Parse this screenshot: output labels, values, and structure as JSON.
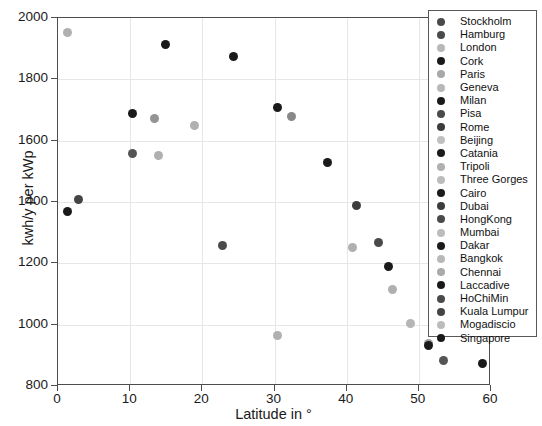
{
  "chart_data": {
    "type": "scatter",
    "title": "",
    "xlabel": "Latitude in °",
    "ylabel": "kwh/y per kWp",
    "xlim": [
      0,
      60
    ],
    "ylim": [
      800,
      2000
    ],
    "xticks": [
      "0",
      "10",
      "20",
      "30",
      "40",
      "50",
      "60"
    ],
    "yticks": [
      "800",
      "1000",
      "1200",
      "1400",
      "1600",
      "1800",
      "2000"
    ],
    "grid": true,
    "legend_position": "top-right-outside",
    "points": [
      {
        "label": "Stockholm",
        "x": 59.0,
        "y": 870,
        "color": "#1a1a1a"
      },
      {
        "label": "Hamburg",
        "x": 53.5,
        "y": 880,
        "color": "#555555"
      },
      {
        "label": "London",
        "x": 51.5,
        "y": 935,
        "color": "#a0a0a0"
      },
      {
        "label": "Cork",
        "x": 51.5,
        "y": 930,
        "color": "#1a1a1a"
      },
      {
        "label": "Paris",
        "x": 49.0,
        "y": 1000,
        "color": "#b5b5b5"
      },
      {
        "label": "Geneva",
        "x": 46.5,
        "y": 1110,
        "color": "#b0b0b0"
      },
      {
        "label": "Milan",
        "x": 46.0,
        "y": 1185,
        "color": "#1a1a1a"
      },
      {
        "label": "Pisa",
        "x": 44.5,
        "y": 1265,
        "color": "#4a4a4a"
      },
      {
        "label": "Rome",
        "x": 41.5,
        "y": 1385,
        "color": "#3c3c3c"
      },
      {
        "label": "Beijing",
        "x": 41.0,
        "y": 1250,
        "color": "#b0b0b0"
      },
      {
        "label": "Catania",
        "x": 37.5,
        "y": 1525,
        "color": "#1a1a1a"
      },
      {
        "label": "Tripoli",
        "x": 32.5,
        "y": 1675,
        "color": "#888888"
      },
      {
        "label": "Three Gorges",
        "x": 30.5,
        "y": 960,
        "color": "#b0b0b0"
      },
      {
        "label": "Cairo",
        "x": 30.5,
        "y": 1705,
        "color": "#1a1a1a"
      },
      {
        "label": "Dubai",
        "x": 24.5,
        "y": 1870,
        "color": "#1a1a1a"
      },
      {
        "label": "HongKong",
        "x": 23.0,
        "y": 1255,
        "color": "#4a4a4a"
      },
      {
        "label": "Mumbai",
        "x": 19.0,
        "y": 1645,
        "color": "#b0b0b0"
      },
      {
        "label": "Dakar",
        "x": 15.0,
        "y": 1910,
        "color": "#1a1a1a"
      },
      {
        "label": "Bangkok",
        "x": 14.0,
        "y": 1550,
        "color": "#b0b0b0"
      },
      {
        "label": "Chennai",
        "x": 13.5,
        "y": 1670,
        "color": "#949494"
      },
      {
        "label": "Laccadive",
        "x": 10.5,
        "y": 1685,
        "color": "#1a1a1a"
      },
      {
        "label": "HoChiMin",
        "x": 10.5,
        "y": 1555,
        "color": "#555555"
      },
      {
        "label": "Kuala Lumpur",
        "x": 3.0,
        "y": 1405,
        "color": "#444444"
      },
      {
        "label": "Mogadiscio",
        "x": 1.5,
        "y": 1950,
        "color": "#b0b0b0"
      },
      {
        "label": "Singapore",
        "x": 1.5,
        "y": 1365,
        "color": "#1a1a1a"
      }
    ],
    "legend_entries": [
      {
        "label": "Stockholm",
        "color": "#4a4a4a"
      },
      {
        "label": "Hamburg",
        "color": "#4a4a4a"
      },
      {
        "label": "London",
        "color": "#b8b8b8"
      },
      {
        "label": "Cork",
        "color": "#1a1a1a"
      },
      {
        "label": "Paris",
        "color": "#a8a8a8"
      },
      {
        "label": "Geneva",
        "color": "#b8b8b8"
      },
      {
        "label": "Milan",
        "color": "#1a1a1a"
      },
      {
        "label": "Pisa",
        "color": "#4a4a4a"
      },
      {
        "label": "Rome",
        "color": "#3c3c3c"
      },
      {
        "label": "Beijing",
        "color": "#c0c0c0"
      },
      {
        "label": "Catania",
        "color": "#1a1a1a"
      },
      {
        "label": "Tripoli",
        "color": "#b0b0b0"
      },
      {
        "label": "Three Gorges",
        "color": "#bcbcbc"
      },
      {
        "label": "Cairo",
        "color": "#1a1a1a"
      },
      {
        "label": "Dubai",
        "color": "#3c3c3c"
      },
      {
        "label": "HongKong",
        "color": "#4a4a4a"
      },
      {
        "label": "Mumbai",
        "color": "#bcbcbc"
      },
      {
        "label": "Dakar",
        "color": "#1a1a1a"
      },
      {
        "label": "Bangkok",
        "color": "#b8b8b8"
      },
      {
        "label": "Chennai",
        "color": "#aaaaaa"
      },
      {
        "label": "Laccadive",
        "color": "#1a1a1a"
      },
      {
        "label": "HoChiMin",
        "color": "#4a4a4a"
      },
      {
        "label": "Kuala Lumpur",
        "color": "#444444"
      },
      {
        "label": "Mogadiscio",
        "color": "#bcbcbc"
      },
      {
        "label": "Singapore",
        "color": "#1a1a1a"
      }
    ]
  }
}
